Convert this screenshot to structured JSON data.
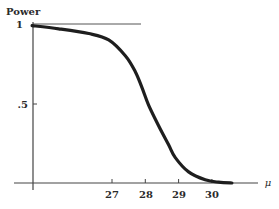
{
  "chart_data": {
    "type": "line",
    "title": "",
    "ylabel": "Power",
    "xlabel": "μ",
    "x_ticks": [
      27,
      28,
      29,
      30
    ],
    "y_ticks": [
      {
        "value": 0.5,
        "label": ".5"
      },
      {
        "value": 1,
        "label": "1"
      }
    ],
    "reference_line": {
      "y": 1,
      "x_from": 24.6,
      "x_to": 27.9
    },
    "xlim": [
      24.6,
      31.9
    ],
    "ylim": [
      0,
      1
    ],
    "grid": false,
    "legend": null,
    "series": [
      {
        "name": "Power curve",
        "x": [
          24.6,
          25.4,
          26.3,
          26.9,
          27.4,
          27.7,
          27.9,
          28.1,
          28.4,
          28.7,
          28.9,
          29.3,
          29.8,
          30.2,
          30.6
        ],
        "values": [
          0.99,
          0.97,
          0.94,
          0.9,
          0.8,
          0.7,
          0.6,
          0.49,
          0.36,
          0.24,
          0.16,
          0.07,
          0.02,
          0.005,
          0.0
        ]
      }
    ]
  },
  "axes": {
    "y_title": "Power",
    "x_title": "μ",
    "x_tick_labels": [
      "27",
      "28",
      "29",
      "30"
    ],
    "y_tick_labels": [
      "1",
      ".5"
    ]
  },
  "colors": {
    "curve": "#1e1e1e",
    "axis": "#444444",
    "text": "#2a2a2a"
  }
}
